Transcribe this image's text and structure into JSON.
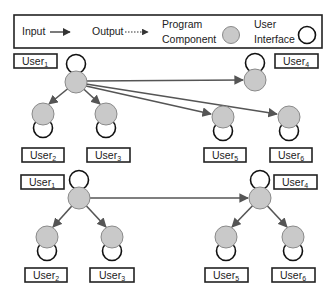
{
  "legend": {
    "input_label": "Input",
    "output_label": "Output",
    "program_component_line1": "Program",
    "program_component_line2": "Component",
    "user_interface_line1": "User",
    "user_interface_line2": "Interface"
  },
  "colors": {
    "program_component_fill": "#c9c9c9",
    "edge": "#555555",
    "user_interface_stroke": "#111111"
  },
  "diagram_top": {
    "description": "Root program component (User1) sends input directly to User2, User3, User4, User5, User6",
    "nodes": [
      {
        "id": "u1",
        "base": "User",
        "sub": "1"
      },
      {
        "id": "u2",
        "base": "User",
        "sub": "2"
      },
      {
        "id": "u3",
        "base": "User",
        "sub": "3"
      },
      {
        "id": "u4",
        "base": "User",
        "sub": "4"
      },
      {
        "id": "u5",
        "base": "User",
        "sub": "5"
      },
      {
        "id": "u6",
        "base": "User",
        "sub": "6"
      }
    ],
    "edges": [
      [
        "u1",
        "u2"
      ],
      [
        "u1",
        "u3"
      ],
      [
        "u1",
        "u4"
      ],
      [
        "u1",
        "u5"
      ],
      [
        "u1",
        "u6"
      ]
    ]
  },
  "diagram_bottom": {
    "description": "Hierarchical: User1 feeds User2, User3, User4; User4 feeds User5, User6",
    "nodes": [
      {
        "id": "u1",
        "base": "User",
        "sub": "1"
      },
      {
        "id": "u2",
        "base": "User",
        "sub": "2"
      },
      {
        "id": "u3",
        "base": "User",
        "sub": "3"
      },
      {
        "id": "u4",
        "base": "User",
        "sub": "4"
      },
      {
        "id": "u5",
        "base": "User",
        "sub": "5"
      },
      {
        "id": "u6",
        "base": "User",
        "sub": "6"
      }
    ],
    "edges": [
      [
        "u1",
        "u2"
      ],
      [
        "u1",
        "u3"
      ],
      [
        "u1",
        "u4"
      ],
      [
        "u4",
        "u5"
      ],
      [
        "u4",
        "u6"
      ]
    ]
  }
}
